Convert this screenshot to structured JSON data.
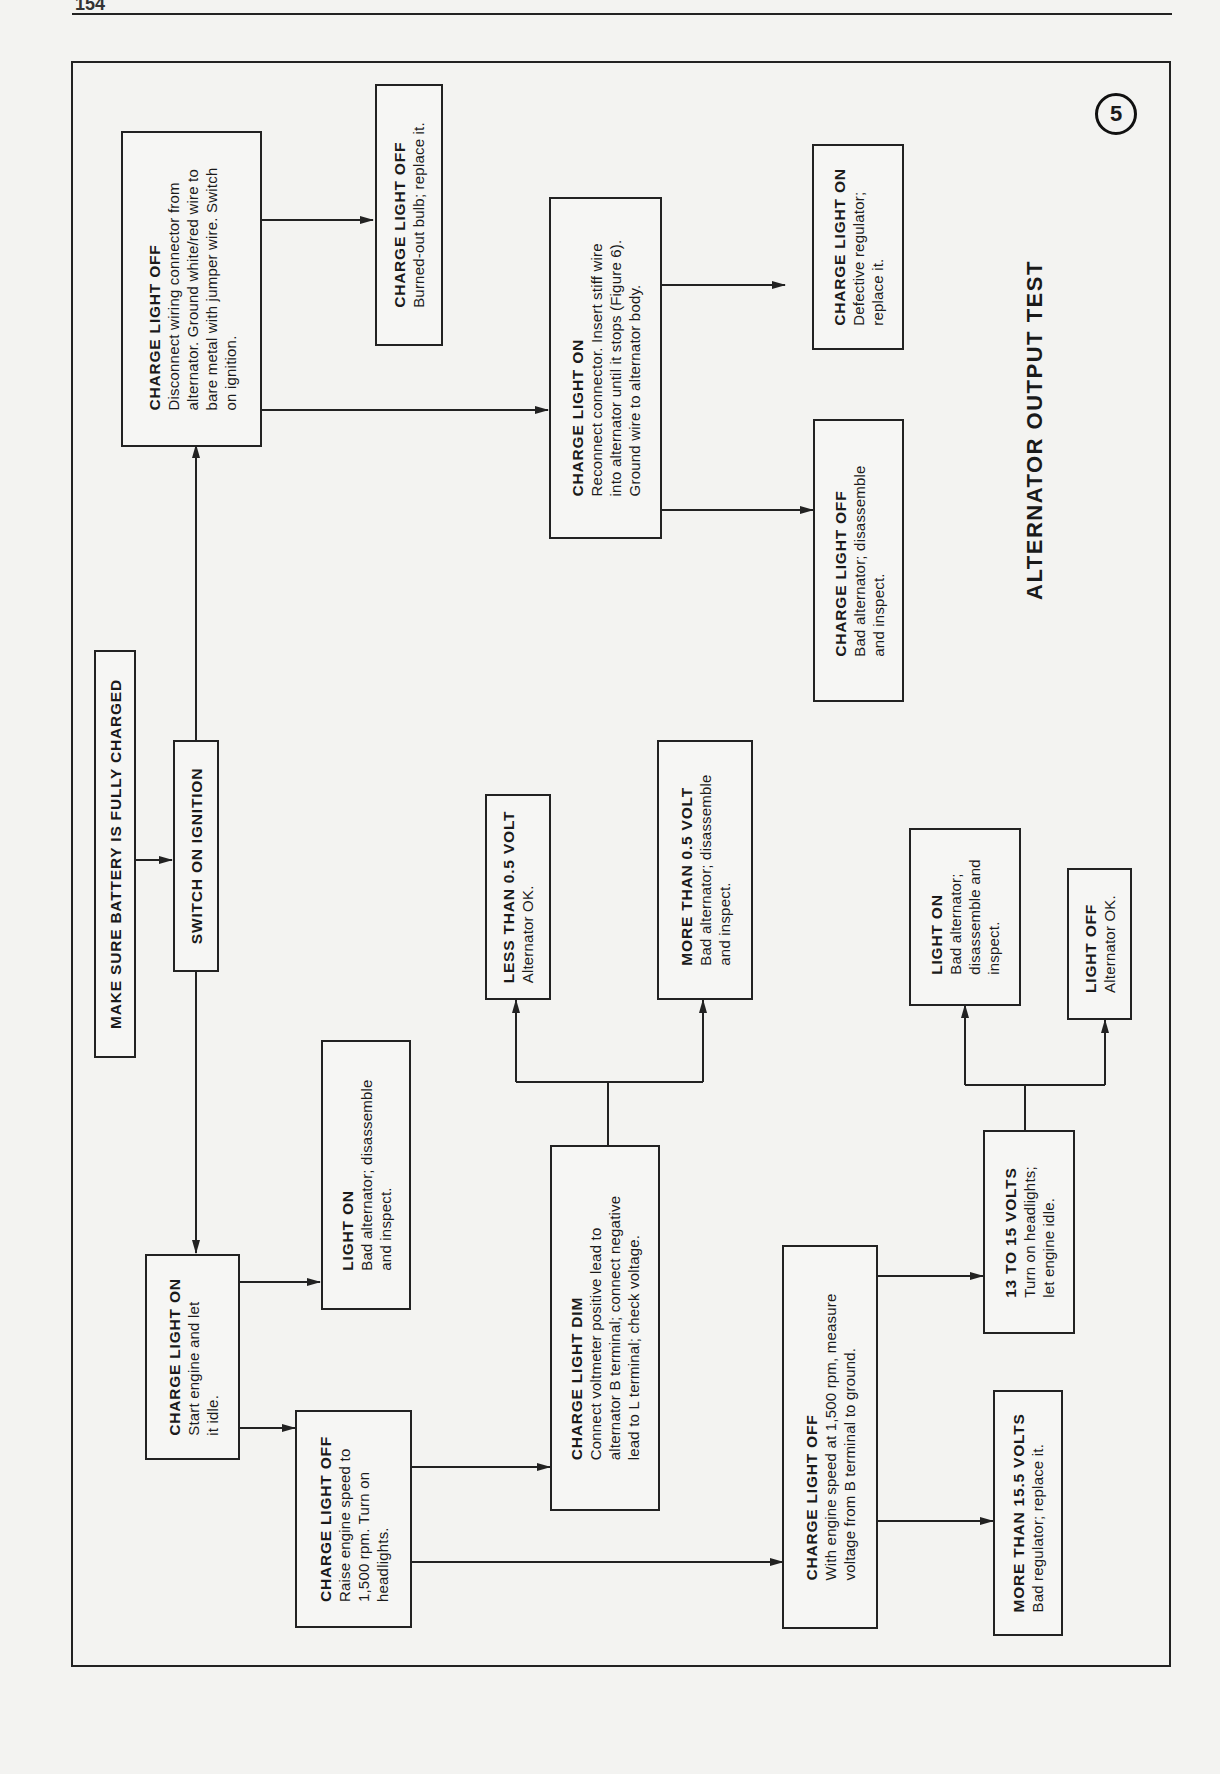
{
  "page": {
    "number": "154"
  },
  "figure": {
    "number": "5",
    "title": "ALTERNATOR OUTPUT TEST"
  },
  "nodes": {
    "battery": {
      "head": "MAKE SURE BATTERY IS FULLY CHARGED",
      "lines": []
    },
    "ignition": {
      "head": "SWITCH ON IGNITION",
      "lines": []
    },
    "cl_off_top": {
      "head": "CHARGE LIGHT OFF",
      "lines": [
        "Disconnect wiring connector from",
        "alternator. Ground white/red wire to",
        "bare metal with jumper wire. Switch",
        "on ignition."
      ]
    },
    "cl_off_bulb": {
      "head": "CHARGE LIGHT OFF",
      "lines": [
        "Burned-out bulb; replace it."
      ]
    },
    "cl_on_reconnect": {
      "head": "CHARGE LIGHT ON",
      "lines": [
        "Reconnect connector. Insert stiff wire",
        "into alternator until it stops (Figure 6).",
        "Ground wire to alternator body."
      ]
    },
    "cl_on_regulator": {
      "head": "CHARGE LIGHT ON",
      "lines": [
        "Defective regulator;",
        "replace it."
      ]
    },
    "cl_off_badalt": {
      "head": "CHARGE LIGHT OFF",
      "lines": [
        "Bad alternator; disassemble",
        "and inspect."
      ]
    },
    "cl_on_start": {
      "head": "CHARGE LIGHT ON",
      "lines": [
        "Start engine and let",
        "it idle."
      ]
    },
    "light_on_left": {
      "head": "LIGHT ON",
      "lines": [
        "Bad alternator; disassemble",
        "and inspect."
      ]
    },
    "cl_off_raise": {
      "head": "CHARGE LIGHT OFF",
      "lines": [
        "Raise engine speed to",
        "1,500 rpm. Turn on",
        "headlights."
      ]
    },
    "cl_dim": {
      "head": "CHARGE LIGHT DIM",
      "lines": [
        "Connect voltmeter positive lead to",
        "alternator B terminal; connect negative",
        "lead to L terminal; check voltage."
      ]
    },
    "less_05": {
      "head": "LESS THAN 0.5 VOLT",
      "lines": [
        "Alternator OK."
      ]
    },
    "more_05": {
      "head": "MORE THAN 0.5 VOLT",
      "lines": [
        "Bad alternator; disassemble",
        "and inspect."
      ]
    },
    "cl_off_measure": {
      "head": "CHARGE LIGHT OFF",
      "lines": [
        "With engine speed at 1,500 rpm, measure",
        "voltage from B terminal to ground."
      ]
    },
    "v13_15": {
      "head": "13 TO 15 VOLTS",
      "lines": [
        "Turn on headlights;",
        "let engine idle."
      ]
    },
    "more_155": {
      "head": "MORE THAN 15.5 VOLTS",
      "lines": [
        "Bad regulator; replace it."
      ]
    },
    "light_on_right": {
      "head": "LIGHT ON",
      "lines": [
        "Bad alternator;",
        "disassemble and",
        "inspect."
      ]
    },
    "light_off_right": {
      "head": "LIGHT OFF",
      "lines": [
        "Alternator OK."
      ]
    }
  },
  "colors": {
    "ink": "#222222",
    "paper": "#f3f3f1"
  }
}
